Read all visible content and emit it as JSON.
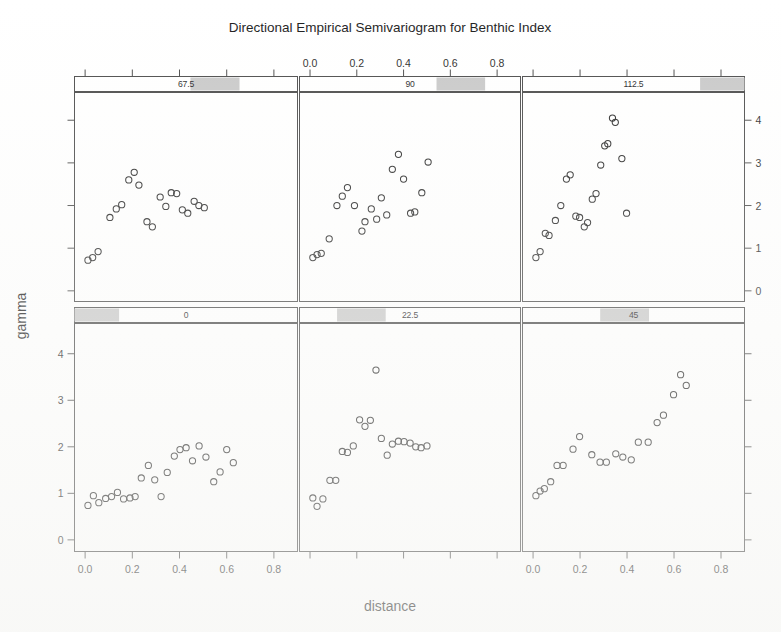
{
  "figure": {
    "title": "Directional Empirical Semivariogram for Benthic Index",
    "xlabel": "distance",
    "ylabel": "gamma"
  },
  "axes": {
    "x_ticks": [
      "0.0",
      "0.2",
      "0.4",
      "0.6",
      "0.8"
    ],
    "y_ticks": [
      "0",
      "1",
      "2",
      "3",
      "4"
    ],
    "x_tick_values": [
      0.0,
      0.2,
      0.4,
      0.6,
      0.8
    ],
    "y_tick_values": [
      0,
      1,
      2,
      3,
      4
    ],
    "xlim": [
      -0.045,
      0.9
    ],
    "ylim": [
      -0.25,
      4.65
    ],
    "top_axis_panel": "90",
    "bottom_axis_panels": [
      "0",
      "45"
    ],
    "left_axis_row": "bottom",
    "right_axis_row": "top"
  },
  "strips": [
    {
      "label": "67.5",
      "shade_start": 0.52,
      "shade_end": 0.74,
      "row": "top",
      "col": 0
    },
    {
      "label": "90",
      "shade_start": 0.62,
      "shade_end": 0.84,
      "row": "top",
      "col": 1
    },
    {
      "label": "112.5",
      "shade_start": 0.8,
      "shade_end": 1.0,
      "row": "top",
      "col": 2
    },
    {
      "label": "0",
      "shade_start": 0.0,
      "shade_end": 0.2,
      "row": "bottom",
      "col": 0
    },
    {
      "label": "22.5",
      "shade_start": 0.17,
      "shade_end": 0.39,
      "row": "bottom",
      "col": 1
    },
    {
      "label": "45",
      "shade_start": 0.35,
      "shade_end": 0.57,
      "row": "bottom",
      "col": 2
    }
  ],
  "chart_data": {
    "type": "scatter",
    "title": "Directional Empirical Semivariogram for Benthic Index",
    "xlabel": "distance",
    "ylabel": "gamma",
    "xlim": [
      -0.045,
      0.9
    ],
    "ylim": [
      -0.25,
      4.65
    ],
    "grid": false,
    "legend": "none",
    "marker": "open-circle",
    "layout": {
      "rows": 2,
      "cols": 3,
      "panel_order": "bottom-left-to-top-right"
    },
    "panel_variable": "direction (degrees)",
    "panels": [
      {
        "name": "0",
        "row": 1,
        "col": 0,
        "points": [
          {
            "x": 0.012,
            "y": 0.74
          },
          {
            "x": 0.035,
            "y": 0.95
          },
          {
            "x": 0.058,
            "y": 0.8
          },
          {
            "x": 0.087,
            "y": 0.89
          },
          {
            "x": 0.112,
            "y": 0.93
          },
          {
            "x": 0.137,
            "y": 1.02
          },
          {
            "x": 0.163,
            "y": 0.88
          },
          {
            "x": 0.19,
            "y": 0.9
          },
          {
            "x": 0.212,
            "y": 0.93
          },
          {
            "x": 0.238,
            "y": 1.33
          },
          {
            "x": 0.268,
            "y": 1.6
          },
          {
            "x": 0.295,
            "y": 1.29
          },
          {
            "x": 0.322,
            "y": 0.93
          },
          {
            "x": 0.348,
            "y": 1.45
          },
          {
            "x": 0.378,
            "y": 1.8
          },
          {
            "x": 0.402,
            "y": 1.94
          },
          {
            "x": 0.428,
            "y": 1.98
          },
          {
            "x": 0.455,
            "y": 1.7
          },
          {
            "x": 0.483,
            "y": 2.02
          },
          {
            "x": 0.512,
            "y": 1.78
          },
          {
            "x": 0.545,
            "y": 1.25
          },
          {
            "x": 0.572,
            "y": 1.46
          },
          {
            "x": 0.6,
            "y": 1.94
          },
          {
            "x": 0.628,
            "y": 1.66
          }
        ]
      },
      {
        "name": "22.5",
        "row": 1,
        "col": 1,
        "points": [
          {
            "x": 0.012,
            "y": 0.9
          },
          {
            "x": 0.03,
            "y": 0.72
          },
          {
            "x": 0.055,
            "y": 0.88
          },
          {
            "x": 0.085,
            "y": 1.28
          },
          {
            "x": 0.11,
            "y": 1.28
          },
          {
            "x": 0.138,
            "y": 1.9
          },
          {
            "x": 0.16,
            "y": 1.88
          },
          {
            "x": 0.185,
            "y": 2.02
          },
          {
            "x": 0.212,
            "y": 2.58
          },
          {
            "x": 0.235,
            "y": 2.44
          },
          {
            "x": 0.258,
            "y": 2.57
          },
          {
            "x": 0.282,
            "y": 3.65
          },
          {
            "x": 0.305,
            "y": 2.18
          },
          {
            "x": 0.33,
            "y": 1.82
          },
          {
            "x": 0.352,
            "y": 2.06
          },
          {
            "x": 0.378,
            "y": 2.12
          },
          {
            "x": 0.402,
            "y": 2.11
          },
          {
            "x": 0.428,
            "y": 2.08
          },
          {
            "x": 0.452,
            "y": 2.0
          },
          {
            "x": 0.475,
            "y": 1.98
          },
          {
            "x": 0.5,
            "y": 2.02
          }
        ]
      },
      {
        "name": "45",
        "row": 1,
        "col": 2,
        "points": [
          {
            "x": 0.012,
            "y": 0.95
          },
          {
            "x": 0.03,
            "y": 1.05
          },
          {
            "x": 0.048,
            "y": 1.1
          },
          {
            "x": 0.075,
            "y": 1.25
          },
          {
            "x": 0.102,
            "y": 1.6
          },
          {
            "x": 0.128,
            "y": 1.6
          },
          {
            "x": 0.17,
            "y": 1.95
          },
          {
            "x": 0.198,
            "y": 2.22
          },
          {
            "x": 0.25,
            "y": 1.83
          },
          {
            "x": 0.285,
            "y": 1.67
          },
          {
            "x": 0.312,
            "y": 1.67
          },
          {
            "x": 0.352,
            "y": 1.85
          },
          {
            "x": 0.382,
            "y": 1.78
          },
          {
            "x": 0.418,
            "y": 1.72
          },
          {
            "x": 0.448,
            "y": 2.1
          },
          {
            "x": 0.49,
            "y": 2.1
          },
          {
            "x": 0.528,
            "y": 2.52
          },
          {
            "x": 0.555,
            "y": 2.68
          },
          {
            "x": 0.598,
            "y": 3.12
          },
          {
            "x": 0.628,
            "y": 3.55
          },
          {
            "x": 0.652,
            "y": 3.32
          }
        ]
      },
      {
        "name": "67.5",
        "row": 0,
        "col": 0,
        "points": [
          {
            "x": 0.012,
            "y": 0.72
          },
          {
            "x": 0.032,
            "y": 0.78
          },
          {
            "x": 0.055,
            "y": 0.92
          },
          {
            "x": 0.105,
            "y": 1.72
          },
          {
            "x": 0.132,
            "y": 1.92
          },
          {
            "x": 0.155,
            "y": 2.02
          },
          {
            "x": 0.185,
            "y": 2.6
          },
          {
            "x": 0.208,
            "y": 2.78
          },
          {
            "x": 0.228,
            "y": 2.48
          },
          {
            "x": 0.262,
            "y": 1.62
          },
          {
            "x": 0.285,
            "y": 1.5
          },
          {
            "x": 0.318,
            "y": 2.2
          },
          {
            "x": 0.342,
            "y": 1.98
          },
          {
            "x": 0.365,
            "y": 2.3
          },
          {
            "x": 0.388,
            "y": 2.28
          },
          {
            "x": 0.412,
            "y": 1.9
          },
          {
            "x": 0.435,
            "y": 1.82
          },
          {
            "x": 0.462,
            "y": 2.1
          },
          {
            "x": 0.482,
            "y": 2.0
          },
          {
            "x": 0.505,
            "y": 1.95
          }
        ]
      },
      {
        "name": "90",
        "row": 0,
        "col": 1,
        "points": [
          {
            "x": 0.012,
            "y": 0.78
          },
          {
            "x": 0.03,
            "y": 0.85
          },
          {
            "x": 0.048,
            "y": 0.88
          },
          {
            "x": 0.082,
            "y": 1.22
          },
          {
            "x": 0.115,
            "y": 2.0
          },
          {
            "x": 0.138,
            "y": 2.22
          },
          {
            "x": 0.16,
            "y": 2.42
          },
          {
            "x": 0.19,
            "y": 2.0
          },
          {
            "x": 0.222,
            "y": 1.4
          },
          {
            "x": 0.235,
            "y": 1.62
          },
          {
            "x": 0.262,
            "y": 1.92
          },
          {
            "x": 0.285,
            "y": 1.68
          },
          {
            "x": 0.305,
            "y": 2.18
          },
          {
            "x": 0.328,
            "y": 1.78
          },
          {
            "x": 0.352,
            "y": 2.85
          },
          {
            "x": 0.378,
            "y": 3.2
          },
          {
            "x": 0.4,
            "y": 2.62
          },
          {
            "x": 0.43,
            "y": 1.82
          },
          {
            "x": 0.448,
            "y": 1.85
          },
          {
            "x": 0.478,
            "y": 2.3
          },
          {
            "x": 0.505,
            "y": 3.02
          }
        ]
      },
      {
        "name": "112.5",
        "row": 0,
        "col": 2,
        "points": [
          {
            "x": 0.012,
            "y": 0.78
          },
          {
            "x": 0.03,
            "y": 0.92
          },
          {
            "x": 0.052,
            "y": 1.35
          },
          {
            "x": 0.068,
            "y": 1.3
          },
          {
            "x": 0.095,
            "y": 1.65
          },
          {
            "x": 0.118,
            "y": 2.0
          },
          {
            "x": 0.142,
            "y": 2.62
          },
          {
            "x": 0.158,
            "y": 2.72
          },
          {
            "x": 0.182,
            "y": 1.75
          },
          {
            "x": 0.198,
            "y": 1.72
          },
          {
            "x": 0.218,
            "y": 1.5
          },
          {
            "x": 0.232,
            "y": 1.6
          },
          {
            "x": 0.252,
            "y": 2.15
          },
          {
            "x": 0.268,
            "y": 2.28
          },
          {
            "x": 0.288,
            "y": 2.95
          },
          {
            "x": 0.305,
            "y": 3.4
          },
          {
            "x": 0.318,
            "y": 3.45
          },
          {
            "x": 0.338,
            "y": 4.05
          },
          {
            "x": 0.35,
            "y": 3.95
          },
          {
            "x": 0.378,
            "y": 3.1
          },
          {
            "x": 0.398,
            "y": 1.82
          }
        ]
      }
    ]
  }
}
